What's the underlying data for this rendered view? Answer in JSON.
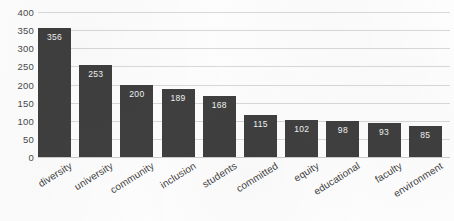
{
  "chart_data": {
    "type": "bar",
    "title": "",
    "xlabel": "",
    "ylabel": "",
    "ylim": [
      0,
      400
    ],
    "ytick_step": 50,
    "yticks": [
      400,
      350,
      300,
      250,
      200,
      150,
      100,
      50,
      0
    ],
    "grid": true,
    "legend": false,
    "value_labels_inside_bars": true,
    "categories": [
      "diversity",
      "university",
      "community",
      "inclusion",
      "students",
      "committed",
      "equity",
      "educational",
      "faculty",
      "environment"
    ],
    "values": [
      356,
      253,
      200,
      189,
      168,
      115,
      102,
      98,
      93,
      85
    ],
    "bars": [
      {
        "category": "diversity",
        "value": 356,
        "label": "356"
      },
      {
        "category": "university",
        "value": 253,
        "label": "253"
      },
      {
        "category": "community",
        "value": 200,
        "label": "200"
      },
      {
        "category": "inclusion",
        "value": 189,
        "label": "189"
      },
      {
        "category": "students",
        "value": 168,
        "label": "168"
      },
      {
        "category": "committed",
        "value": 115,
        "label": "115"
      },
      {
        "category": "equity",
        "value": 102,
        "label": "102"
      },
      {
        "category": "educational",
        "value": 98,
        "label": "98"
      },
      {
        "category": "faculty",
        "value": 93,
        "label": "93"
      },
      {
        "category": "environment",
        "value": 85,
        "label": "85"
      }
    ],
    "colors": {
      "bar": "#3f3f3f",
      "value_label": "#f2f2f2",
      "gridline": "#d8d8d8",
      "axis_text": "#4a4a4a",
      "category_text": "#3d3d3d",
      "background": "#fdfdfd"
    }
  }
}
